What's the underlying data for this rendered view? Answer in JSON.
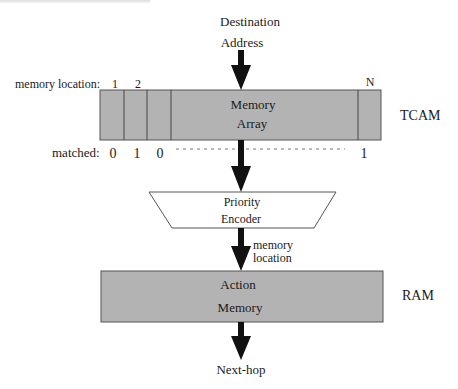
{
  "diagram": {
    "input_label_line1": "Destination",
    "input_label_line2": "Address",
    "memory_location_label": "memory location:",
    "location_indices": [
      "1",
      "2",
      "N"
    ],
    "tcam_box_line1": "Memory",
    "tcam_box_line2": "Array",
    "tcam_label": "TCAM",
    "matched_label": "matched:",
    "matched_values": [
      "0",
      "1",
      "0",
      "1"
    ],
    "encoder_line1": "Priority",
    "encoder_line2": "Encoder",
    "encoder_output_line1": "memory",
    "encoder_output_line2": "location",
    "ram_box_line1": "Action",
    "ram_box_line2": "Memory",
    "ram_label": "RAM",
    "output_label": "Next-hop"
  },
  "colors": {
    "box_fill": "#b3b3b3",
    "box_stroke": "#555555",
    "arrow": "#111111"
  }
}
